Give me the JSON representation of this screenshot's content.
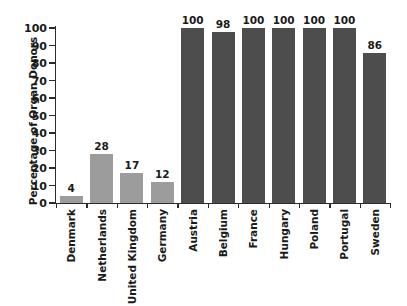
{
  "chart_data": {
    "type": "bar",
    "title": "",
    "xlabel": "",
    "ylabel": "Percentage of Organ Donors",
    "ylim": [
      0,
      100
    ],
    "y_ticks": [
      0,
      10,
      20,
      30,
      40,
      50,
      60,
      70,
      80,
      90,
      100
    ],
    "grid": false,
    "legend": "none",
    "categories": [
      "Denmark",
      "Netherlands",
      "United Kingdom",
      "Germany",
      "Austria",
      "Belgium",
      "France",
      "Hungary",
      "Poland",
      "Portugal",
      "Sweden"
    ],
    "values": [
      4,
      28,
      17,
      12,
      100,
      98,
      100,
      100,
      100,
      100,
      86
    ],
    "bar_colors": [
      "#9c9c9c",
      "#9c9c9c",
      "#9c9c9c",
      "#9c9c9c",
      "#4d4d4d",
      "#4d4d4d",
      "#4d4d4d",
      "#4d4d4d",
      "#4d4d4d",
      "#4d4d4d",
      "#4d4d4d"
    ],
    "value_labels": [
      "4",
      "28",
      "17",
      "12",
      "100",
      "98",
      "100",
      "100",
      "100",
      "100",
      "86"
    ],
    "colors": {
      "light_group": "#9c9c9c",
      "dark_group": "#4d4d4d",
      "axis": "#2b2b2b",
      "text": "#1a1a1a",
      "background": "#ffffff"
    }
  }
}
